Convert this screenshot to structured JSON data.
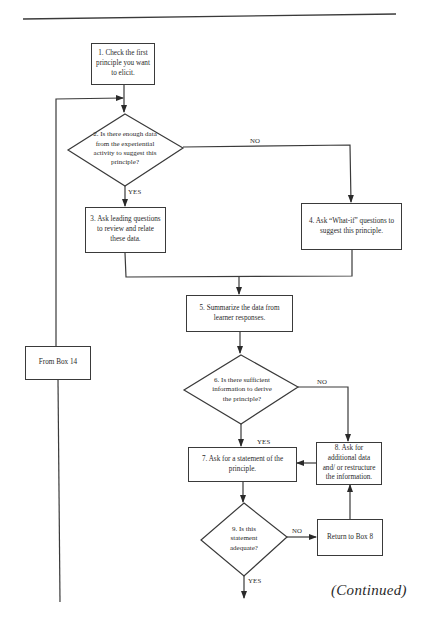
{
  "flowchart": {
    "nodes": {
      "box1": {
        "id": 1,
        "shape": "process",
        "text": "1. Check the first principle you want to elicit."
      },
      "decision2": {
        "id": 2,
        "shape": "decision",
        "text": "2. Is there enough data from the experiential activity to suggest this principle?"
      },
      "box3": {
        "id": 3,
        "shape": "process",
        "text": "3. Ask leading questions to review and relate these data."
      },
      "box4": {
        "id": 4,
        "shape": "process",
        "text": "4. Ask “What-if” questions to suggest this principle."
      },
      "box5": {
        "id": 5,
        "shape": "process",
        "text": "5. Summarize the data from learner responses."
      },
      "decision6": {
        "id": 6,
        "shape": "decision",
        "text": "6. Is there sufficient information to derive the principle?"
      },
      "box7": {
        "id": 7,
        "shape": "process",
        "text": "7. Ask for a statement of the principle."
      },
      "box8": {
        "id": 8,
        "shape": "process",
        "text": "8. Ask for additional data and/ or restructure the information."
      },
      "decision9": {
        "id": 9,
        "shape": "decision",
        "text": "9. Is this statement adequate?"
      },
      "return8": {
        "shape": "connector",
        "text": "Return to Box 8"
      },
      "from14": {
        "shape": "connector",
        "text": "From Box 14"
      }
    },
    "edge_labels": {
      "d2_no": "NO",
      "d2_yes": "YES",
      "d6_no": "NO",
      "d6_yes": "YES",
      "d9_no": "NO",
      "d9_yes": "YES"
    },
    "edges": [
      {
        "from": "box1",
        "to": "decision2"
      },
      {
        "from": "from14",
        "to": "decision2"
      },
      {
        "from": "decision2",
        "to": "box3",
        "label": "YES"
      },
      {
        "from": "decision2",
        "to": "box4",
        "label": "NO"
      },
      {
        "from": "box3",
        "to": "box5"
      },
      {
        "from": "box4",
        "to": "box5"
      },
      {
        "from": "box5",
        "to": "decision6"
      },
      {
        "from": "decision6",
        "to": "box7",
        "label": "YES"
      },
      {
        "from": "decision6",
        "to": "box8",
        "label": "NO"
      },
      {
        "from": "box8",
        "to": "box7"
      },
      {
        "from": "box7",
        "to": "decision9"
      },
      {
        "from": "decision9",
        "to": "return8",
        "label": "NO"
      },
      {
        "from": "return8",
        "to": "box8"
      },
      {
        "from": "decision9",
        "to": "continued",
        "label": "YES"
      }
    ]
  },
  "footer": {
    "continued": "(Continued)"
  },
  "colors": {
    "line": "#3a3a3a",
    "text": "#2a2a2a",
    "background": "#ffffff"
  }
}
